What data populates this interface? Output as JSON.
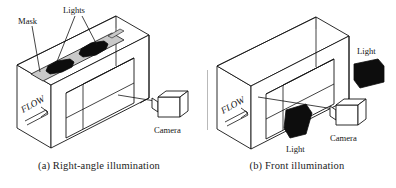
{
  "figure": {
    "type": "technical-diagram",
    "background_color": "#ffffff",
    "line_color": "#141414",
    "mask_color": "#c9c9c9",
    "light_color": "#0d0d0d"
  },
  "panels": [
    {
      "id": "a",
      "caption": "(a) Right-angle illumination",
      "labels": {
        "mask": "Mask",
        "lights": "Lights",
        "flow": "FLOW",
        "camera": "Camera"
      },
      "components": {
        "duct": "rectangular-duct",
        "mask_strip": "mask-strip-on-top-face",
        "light_count": 2,
        "light_placement": "on-top-of-duct",
        "camera_placement": "right-side-front"
      }
    },
    {
      "id": "b",
      "caption": "(b) Front illumination",
      "labels": {
        "light_upper": "Light",
        "light_lower": "Light",
        "flow": "FLOW",
        "camera": "Camera"
      },
      "components": {
        "duct": "rectangular-duct",
        "mask_strip": null,
        "light_count": 2,
        "light_placement": "outside-front-of-duct",
        "camera_placement": "right-side-front"
      }
    }
  ]
}
